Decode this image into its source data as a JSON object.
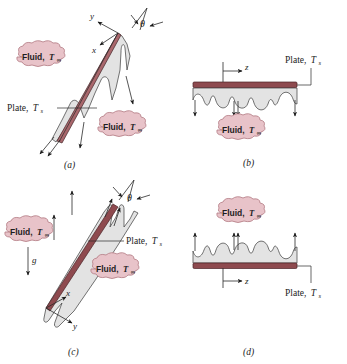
{
  "figure": {
    "background_color": "#ffffff",
    "colors": {
      "plume_fill": "#e3e3e3",
      "plate_dark": "#8e4a4f",
      "plate_light": "#a9676c",
      "callout_fill": "#e8c3c9",
      "callout_stroke": "#b9848c",
      "ink": "#1b1b1b"
    }
  },
  "labels": {
    "fluid": "Fluid,",
    "fluid_symbol": "T",
    "fluid_subscript": "∞",
    "plate": "Plate,",
    "plate_symbol": "T",
    "plate_subscript": "s",
    "theta": "θ",
    "gravity": "g",
    "axis_x": "x",
    "axis_y": "y",
    "axis_z": "z"
  },
  "panels": [
    {
      "id": "a",
      "caption": "(a)",
      "description": "Heated inclined plate, cold side facing down; plumes descend",
      "flow_direction": "downward",
      "plate_orientation": "inclined",
      "has_theta": true,
      "has_gravity_vector": false,
      "axes": [
        "x",
        "y"
      ],
      "callouts": [
        "Fluid, T∞",
        "Fluid, T∞",
        "Plate, Ts"
      ]
    },
    {
      "id": "b",
      "caption": "(b)",
      "description": "Horizontal plate with flow descending beneath",
      "flow_direction": "downward",
      "plate_orientation": "horizontal",
      "has_theta": false,
      "has_gravity_vector": false,
      "axes": [
        "z"
      ],
      "callouts": [
        "Fluid, T∞",
        "Plate, Ts"
      ]
    },
    {
      "id": "c",
      "caption": "(c)",
      "description": "Inclined plate with plumes rising, gravity shown downward",
      "flow_direction": "upward",
      "plate_orientation": "inclined",
      "has_theta": true,
      "has_gravity_vector": true,
      "axes": [
        "x",
        "y"
      ],
      "callouts": [
        "Fluid, T∞",
        "Fluid, T∞",
        "Plate, Ts"
      ]
    },
    {
      "id": "d",
      "caption": "(d)",
      "description": "Horizontal plate with flow rising above",
      "flow_direction": "upward",
      "plate_orientation": "horizontal",
      "has_theta": false,
      "has_gravity_vector": false,
      "axes": [
        "z"
      ],
      "callouts": [
        "Fluid, T∞",
        "Plate, Ts"
      ]
    }
  ]
}
